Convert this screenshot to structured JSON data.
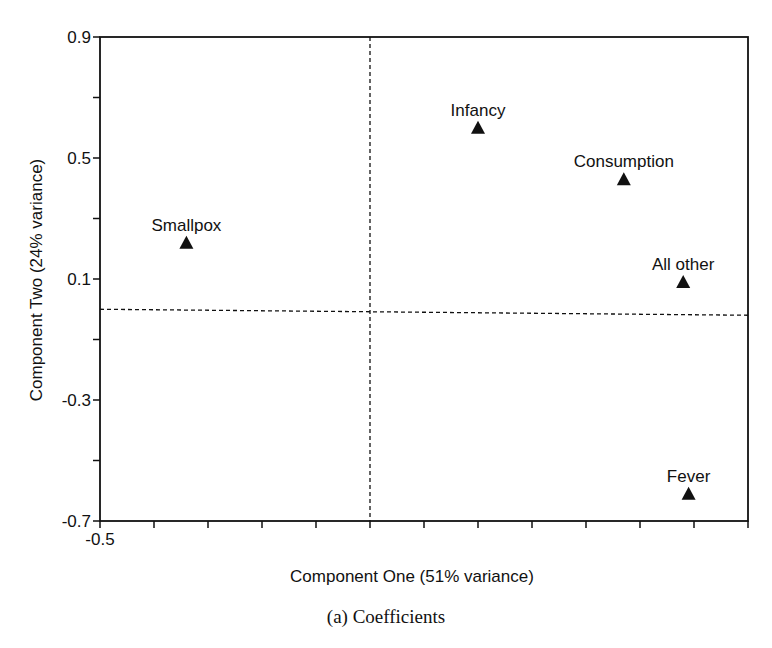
{
  "chart_data": {
    "type": "scatter",
    "title": "",
    "caption": "(a) Coefficients",
    "xlabel": "Component One (51% variance)",
    "ylabel": "Component Two (24% variance)",
    "xlim": [
      -0.5,
      0.7
    ],
    "ylim": [
      -0.7,
      0.9
    ],
    "x_tick_labels": [
      "-0.5"
    ],
    "y_tick_labels": [
      "0.9",
      "0.5",
      "0.1",
      "-0.3",
      "-0.7"
    ],
    "y_ticks": [
      0.9,
      0.7,
      0.5,
      0.3,
      0.1,
      -0.1,
      -0.3,
      -0.5,
      -0.7
    ],
    "x_ticks": [
      -0.5,
      -0.4,
      -0.3,
      -0.2,
      -0.1,
      0.0,
      0.1,
      0.2,
      0.3,
      0.4,
      0.5,
      0.6,
      0.7
    ],
    "reference_lines": {
      "x": 0.0,
      "y": 0.0,
      "style": "dashed"
    },
    "grid": false,
    "legend": null,
    "marker": "triangle",
    "points": [
      {
        "label": "Smallpox",
        "x": -0.34,
        "y": 0.22
      },
      {
        "label": "Infancy",
        "x": 0.2,
        "y": 0.6
      },
      {
        "label": "Consumption",
        "x": 0.47,
        "y": 0.43
      },
      {
        "label": "All other",
        "x": 0.58,
        "y": 0.09
      },
      {
        "label": "Fever",
        "x": 0.59,
        "y": -0.61
      }
    ]
  },
  "colors": {
    "ink": "#111111",
    "background": "#ffffff"
  }
}
